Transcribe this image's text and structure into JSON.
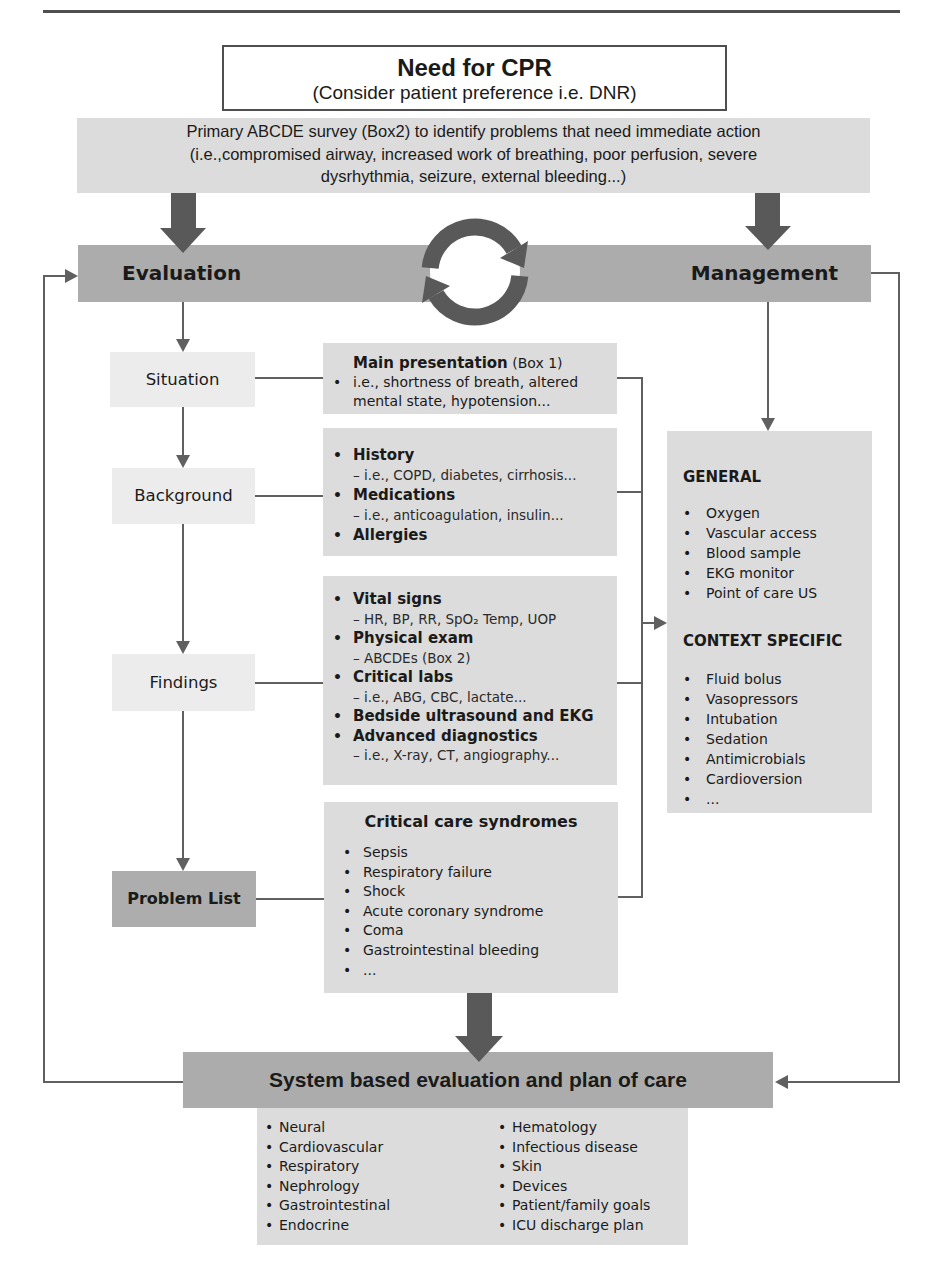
{
  "colors": {
    "rule": "#4f4f4f",
    "dark": "#acacac",
    "light": "#dcdcdc",
    "pale": "#ececec",
    "problem": "#adadad",
    "arrow": "#595959",
    "line": "#606060"
  },
  "cpr_box": {
    "title": "Need for CPR",
    "subtitle": "(Consider patient preference i.e. DNR)"
  },
  "primary_survey": {
    "lines": [
      "Primary ABCDE survey (Box2) to identify problems that need immediate action",
      "(i.e.,compromised airway, increased work of breathing, poor perfusion, severe",
      "dysrhythmia,  seizure, external bleeding...)"
    ]
  },
  "cycle_bar": {
    "left_label": "Evaluation",
    "right_label": "Management",
    "center_icon": "cycle-arrows-icon"
  },
  "evaluation_steps": [
    {
      "label": "Situation"
    },
    {
      "label": "Background"
    },
    {
      "label": "Findings"
    },
    {
      "label": "Problem List"
    }
  ],
  "main_presentation": {
    "title": "Main presentation",
    "ref": " (Box 1)",
    "lines": [
      "i.e., shortness of breath, altered",
      "mental state, hypotension..."
    ]
  },
  "background_info": {
    "items": [
      {
        "title": "History",
        "detail": "– i.e., COPD, diabetes, cirrhosis..."
      },
      {
        "title": "Medications",
        "detail": "– i.e., anticoagulation, insulin..."
      },
      {
        "title": "Allergies"
      }
    ]
  },
  "findings_info": {
    "items": [
      {
        "title": "Vital signs",
        "detail": "– HR, BP, RR, SpO₂ Temp, UOP"
      },
      {
        "title": "Physical exam",
        "detail": "– ABCDEs (Box 2)"
      },
      {
        "title": "Critical  labs",
        "detail": "– i.e., ABG, CBC, lactate..."
      },
      {
        "title": "Bedside ultrasound and EKG"
      },
      {
        "title": "Advanced diagnostics",
        "detail": "– i.e., X-ray, CT, angiography..."
      }
    ]
  },
  "critical_care": {
    "title": "Critical care syndromes",
    "items": [
      "Sepsis",
      "Respiratory failure",
      "Shock",
      "Acute coronary syndrome",
      "Coma",
      "Gastrointestinal bleeding",
      "..."
    ]
  },
  "management_box": {
    "general": {
      "heading": "GENERAL",
      "items": [
        "Oxygen",
        "Vascular access",
        "Blood sample",
        "EKG  monitor",
        "Point of care US"
      ]
    },
    "context": {
      "heading": "CONTEXT SPECIFIC",
      "items": [
        "Fluid bolus",
        "Vasopressors",
        "Intubation",
        "Sedation",
        "Antimicrobials",
        "Cardioversion",
        "..."
      ]
    }
  },
  "system_plan": {
    "title": "System based evaluation and plan of care",
    "left_items": [
      "Neural",
      "Cardiovascular",
      "Respiratory",
      "Nephrology",
      "Gastrointestinal",
      "Endocrine"
    ],
    "right_items": [
      "Hematology",
      "Infectious disease",
      "Skin",
      "Devices",
      "Patient/family goals",
      "ICU discharge plan"
    ]
  }
}
